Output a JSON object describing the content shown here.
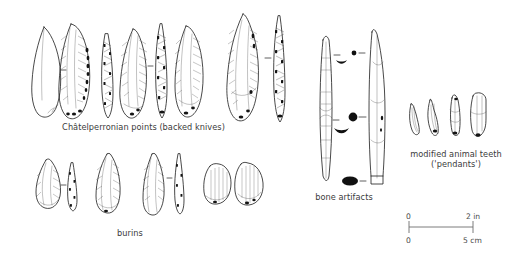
{
  "plate": {
    "title": "Châtelperronian artifact plate",
    "background_color": "#ffffff",
    "ink_color": "#1a1a1a",
    "caption_color": "#3b3b3b",
    "scale_color": "#6e6e6e"
  },
  "groups": {
    "points": {
      "caption": "Châtelperronian points (backed knives)",
      "artifact_count": 10,
      "note": "paired face and profile views of backed blade points"
    },
    "burins": {
      "caption": "burins",
      "artifact_count": 7
    },
    "bone": {
      "caption": "bone artifacts",
      "artifact_count": 2,
      "cross_sections": 3
    },
    "teeth": {
      "caption_line1": "modified animal teeth",
      "caption_line2": "('pendants')",
      "artifact_count": 4
    }
  },
  "scale_bar": {
    "zero_top": "0",
    "zero_bottom": "0",
    "top_unit_label": "2 in",
    "bottom_unit_label": "5 cm",
    "top_value": 2,
    "top_unit": "in",
    "bottom_value": 5,
    "bottom_unit": "cm"
  }
}
